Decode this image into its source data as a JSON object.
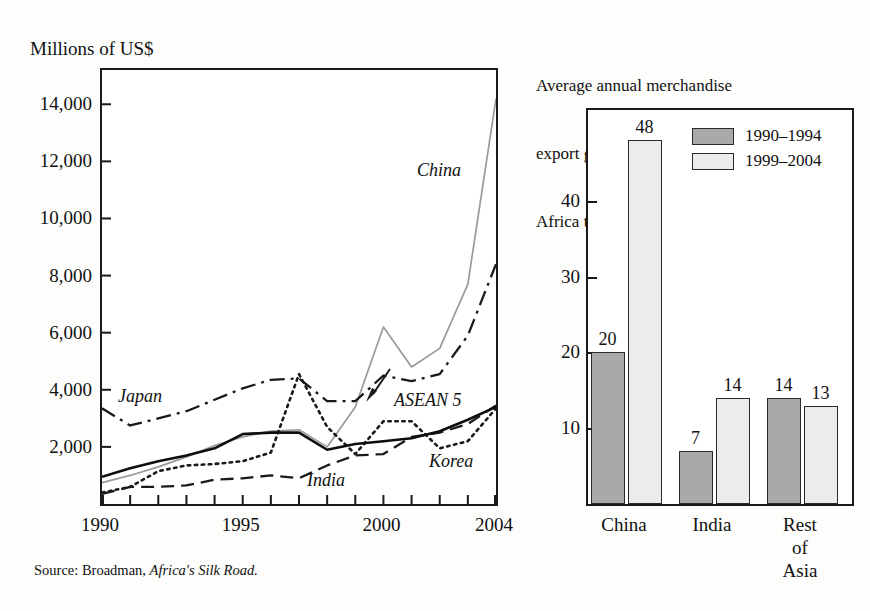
{
  "source_note": "Source: Broadman, Africa's Silk Road.",
  "source_prefix": "Source: Broadman, ",
  "source_title": "Africa's Silk Road.",
  "left_chart": {
    "axis_title": "Millions of US$",
    "series_labels": {
      "china": "China",
      "japan": "Japan",
      "asean": "ASEAN 5",
      "india": "India",
      "korea": "Korea"
    }
  },
  "right_chart": {
    "title_line1": "Average annual merchandise",
    "title_line2": "export growth rate,",
    "title_line3": "Africa to Asia (percent)",
    "legend": [
      {
        "label": "1990–1994",
        "color": "#a9a9a9"
      },
      {
        "label": "1999–2004",
        "color": "#ececec"
      }
    ]
  },
  "chart_data": [
    {
      "type": "line",
      "title": "",
      "ylabel": "Millions of US$",
      "xlabel": "",
      "xlim": [
        1990,
        2004
      ],
      "ylim": [
        0,
        15200
      ],
      "yticks": [
        2000,
        4000,
        6000,
        8000,
        10000,
        12000,
        14000
      ],
      "ytick_labels": [
        "2,000",
        "4,000",
        "6,000",
        "8,000",
        "10,000",
        "12,000",
        "14,000"
      ],
      "xticks": [
        1990,
        1991,
        1992,
        1993,
        1994,
        1995,
        1996,
        1997,
        1998,
        1999,
        2000,
        2001,
        2002,
        2003,
        2004
      ],
      "xtick_labels_shown": [
        "1990",
        "1995",
        "2000",
        "2004"
      ],
      "xtick_labels_shown_at": [
        1990,
        1995,
        2000,
        2004
      ],
      "grid": false,
      "legend_position": "inline-annotations",
      "x": [
        1990,
        1991,
        1992,
        1993,
        1994,
        1995,
        1996,
        1997,
        1998,
        1999,
        2000,
        2001,
        2002,
        2003,
        2004
      ],
      "series": [
        {
          "name": "China",
          "style": "solid-thin-gray",
          "color": "#9a9a9a",
          "values": [
            750,
            1000,
            1300,
            1650,
            2050,
            2350,
            2550,
            2600,
            2000,
            3400,
            6200,
            4800,
            5450,
            7700,
            14200
          ]
        },
        {
          "name": "Japan",
          "style": "dash-dot",
          "color": "#1a1a1a",
          "values": [
            3350,
            2750,
            3000,
            3250,
            3650,
            4050,
            4350,
            4400,
            3600,
            3600,
            4500,
            4300,
            4550,
            5900,
            8400
          ]
        },
        {
          "name": "ASEAN 5",
          "style": "dotted",
          "color": "#1a1a1a",
          "values": [
            400,
            600,
            1150,
            1350,
            1400,
            1500,
            1800,
            4550,
            2700,
            1750,
            2900,
            2900,
            1950,
            2200,
            3350
          ]
        },
        {
          "name": "India",
          "style": "dashed",
          "color": "#1a1a1a",
          "values": [
            350,
            600,
            600,
            650,
            850,
            900,
            1000,
            900,
            1350,
            1700,
            1750,
            2350,
            2500,
            2800,
            3450
          ]
        },
        {
          "name": "Korea",
          "style": "solid-black",
          "color": "#0d0d0d",
          "values": [
            950,
            1250,
            1500,
            1700,
            1950,
            2450,
            2500,
            2500,
            1900,
            2100,
            2200,
            2300,
            2550,
            2950,
            3400
          ]
        }
      ],
      "annotations": [
        "China",
        "Japan",
        "ASEAN 5",
        "India",
        "Korea"
      ]
    },
    {
      "type": "bar",
      "title": "Average annual merchandise export growth rate, Africa to Asia (percent)",
      "xlabel": "",
      "ylabel": "",
      "ylim": [
        0,
        52
      ],
      "yticks": [
        10,
        20,
        30,
        40
      ],
      "ytick_labels": [
        "10",
        "20",
        "30",
        "40"
      ],
      "grid": false,
      "legend_position": "top-right-inside",
      "categories": [
        "China",
        "India",
        "Rest of Asia"
      ],
      "category_labels_display": [
        "China",
        "India",
        "Rest of\nAsia"
      ],
      "series": [
        {
          "name": "1990–1994",
          "color": "#a9a9a9",
          "values": [
            20,
            7,
            14
          ]
        },
        {
          "name": "1999–2004",
          "color": "#ececec",
          "values": [
            48,
            14,
            13
          ]
        }
      ]
    }
  ]
}
